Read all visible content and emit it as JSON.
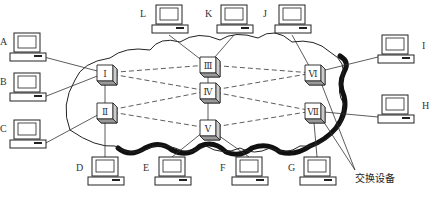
{
  "diagram": {
    "title": "",
    "annotation": "交换设备",
    "colors": {
      "line": "#333333",
      "cloud_shadow": "#111111",
      "background": "#ffffff"
    },
    "hosts": [
      {
        "id": "A",
        "label": "A",
        "x": 10,
        "y": 33
      },
      {
        "id": "B",
        "label": "B",
        "x": 10,
        "y": 73
      },
      {
        "id": "C",
        "label": "C",
        "x": 10,
        "y": 120
      },
      {
        "id": "D",
        "label": "D",
        "x": 88,
        "y": 157
      },
      {
        "id": "E",
        "label": "E",
        "x": 155,
        "y": 157
      },
      {
        "id": "F",
        "label": "F",
        "x": 232,
        "y": 157
      },
      {
        "id": "G",
        "label": "G",
        "x": 300,
        "y": 157
      },
      {
        "id": "H",
        "label": "H",
        "x": 378,
        "y": 95
      },
      {
        "id": "I",
        "label": "I",
        "x": 378,
        "y": 35
      },
      {
        "id": "J",
        "label": "J",
        "x": 275,
        "y": 5
      },
      {
        "id": "K",
        "label": "K",
        "x": 217,
        "y": 5
      },
      {
        "id": "L",
        "label": "L",
        "x": 152,
        "y": 5
      }
    ],
    "nodes": [
      {
        "id": "n1",
        "label": "Ⅰ",
        "x": 97,
        "y": 65
      },
      {
        "id": "n2",
        "label": "Ⅱ",
        "x": 97,
        "y": 103
      },
      {
        "id": "n3",
        "label": "Ⅲ",
        "x": 200,
        "y": 57
      },
      {
        "id": "n4",
        "label": "Ⅳ",
        "x": 200,
        "y": 83
      },
      {
        "id": "n5",
        "label": "Ⅴ",
        "x": 200,
        "y": 120
      },
      {
        "id": "n6",
        "label": "Ⅵ",
        "x": 305,
        "y": 65
      },
      {
        "id": "n7",
        "label": "Ⅶ",
        "x": 305,
        "y": 103
      }
    ],
    "links_solid": [
      [
        "A",
        "n1"
      ],
      [
        "B",
        "n1"
      ],
      [
        "C",
        "n2"
      ],
      [
        "D",
        "n2"
      ],
      [
        "n1",
        "n2"
      ],
      [
        "L",
        "n3"
      ],
      [
        "K",
        "n3"
      ],
      [
        "n3",
        "n4"
      ],
      [
        "n4",
        "n5"
      ],
      [
        "E",
        "n5"
      ],
      [
        "F",
        "n5"
      ],
      [
        "J",
        "n6"
      ],
      [
        "I",
        "n6"
      ],
      [
        "H",
        "n7"
      ],
      [
        "G",
        "n7"
      ]
    ],
    "links_dashed": [
      [
        "n1",
        "n3"
      ],
      [
        "n1",
        "n4"
      ],
      [
        "n2",
        "n4"
      ],
      [
        "n2",
        "n5"
      ],
      [
        "n3",
        "n6"
      ],
      [
        "n4",
        "n6"
      ],
      [
        "n4",
        "n7"
      ],
      [
        "n5",
        "n7"
      ]
    ]
  }
}
